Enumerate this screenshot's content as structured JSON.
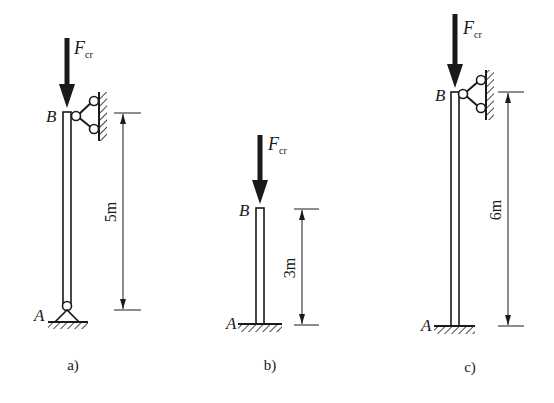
{
  "diagram": {
    "type": "column-buckling-cases",
    "colors": {
      "ink": "#1a1a1a",
      "background": "#ffffff"
    },
    "force_label": {
      "main": "F",
      "subscript": "cr"
    },
    "panels": [
      {
        "id": "a",
        "caption": "a)",
        "top_node": "B",
        "bottom_node": "A",
        "length_label": "5m",
        "bottom_support": "pin",
        "top_support": "lateral-link-to-wall"
      },
      {
        "id": "b",
        "caption": "b)",
        "top_node": "B",
        "bottom_node": "A",
        "length_label": "3m",
        "bottom_support": "fixed",
        "top_support": "free"
      },
      {
        "id": "c",
        "caption": "c)",
        "top_node": "B",
        "bottom_node": "A",
        "length_label": "6m",
        "bottom_support": "fixed",
        "top_support": "lateral-link-to-wall"
      }
    ]
  }
}
